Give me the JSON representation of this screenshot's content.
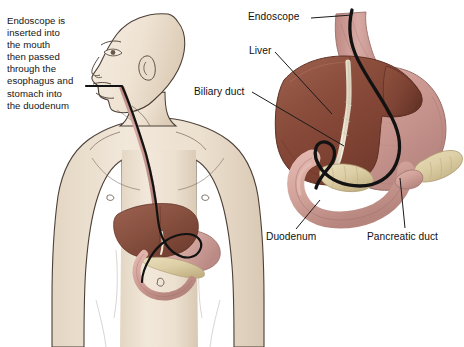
{
  "figure": {
    "background_color": "#ffffff",
    "width": 464,
    "height": 347
  },
  "caption": {
    "text": "Endoscope is\ninserted into\nthe mouth\nthen passed\nthrough the\nesophagus and\nstomach into\nthe duodenum",
    "lines": [
      "Endoscope is",
      "inserted into",
      "the mouth",
      "then passed",
      "through the",
      "esophagus and",
      "stomach into",
      "the duodenum"
    ]
  },
  "labels": {
    "endoscope": "Endoscope",
    "liver": "Liver",
    "biliary_duct": "Biliary duct",
    "duodenum": "Duodenum",
    "pancreatic_duct": "Pancreatic duct"
  },
  "colors": {
    "skin": "#efe4d4",
    "skin_shadow": "#ded0bd",
    "skin_outline": "#4c4038",
    "liver": "#8e4f3e",
    "liver_dark": "#6e382b",
    "liver_light": "#a76350",
    "stomach": "#c49089",
    "stomach_light": "#dcb0a9",
    "esophagus": "#c7928c",
    "duodenum": "#d3a199",
    "pancreas": "#ddcfa6",
    "pancreas_dark": "#c5b488",
    "bile_duct": "#efe7d7",
    "endoscope": "#121212",
    "leader_line": "#1a1a1a",
    "text": "#111111"
  },
  "anatomy": [
    {
      "name": "head-profile",
      "side": "left",
      "description": "Male head in left-facing profile"
    },
    {
      "name": "torso",
      "side": "left",
      "description": "Male upper torso with arms"
    },
    {
      "name": "esophagus",
      "side": "both",
      "description": "Tube from mouth to stomach"
    },
    {
      "name": "liver",
      "side": "both",
      "description": "Large brown organ"
    },
    {
      "name": "stomach",
      "side": "both",
      "description": "Pink J-shaped organ"
    },
    {
      "name": "duodenum",
      "side": "both",
      "description": "C-shaped small intestine segment"
    },
    {
      "name": "pancreas",
      "side": "both",
      "description": "Tan gland behind stomach"
    },
    {
      "name": "biliary-duct",
      "side": "right",
      "description": "Pale duct from liver"
    },
    {
      "name": "endoscope-tube",
      "side": "both",
      "description": "Black flexible scope"
    }
  ]
}
